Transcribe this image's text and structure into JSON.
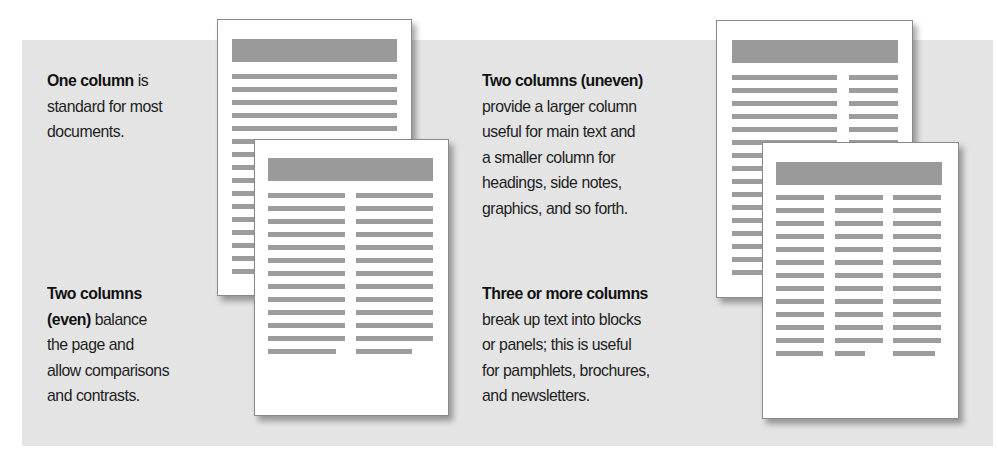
{
  "blocks": [
    {
      "id": "one-column",
      "title": "One column",
      "lines": [
        " is",
        "standard for most",
        "documents."
      ]
    },
    {
      "id": "two-columns-even",
      "title_lines": [
        "Two columns",
        "(even)"
      ],
      "lines": [
        " balance",
        "the page and",
        "allow comparisons",
        "and contrasts."
      ]
    },
    {
      "id": "two-columns-uneven",
      "title": "Two columns (uneven)",
      "lines": [
        "provide a larger column",
        "useful for main text and",
        "a smaller column for",
        "headings, side notes,",
        "graphics, and so forth."
      ]
    },
    {
      "id": "three-columns",
      "title": "Three or more columns",
      "lines": [
        "break up text into blocks",
        "or panels; this is useful",
        "for pamphlets, brochures,",
        "and newsletters."
      ]
    }
  ],
  "pages": [
    {
      "layout": "one-column",
      "rows": 16
    },
    {
      "layout": "two-columns-even",
      "rows": 13
    },
    {
      "layout": "two-columns-uneven",
      "rows": 16
    },
    {
      "layout": "three-columns",
      "rows": 13
    }
  ],
  "colors": {
    "panel_bg": "#e4e4e4",
    "page_bg": "#ffffff",
    "bar_gray": "#9c9c9c",
    "text": "#1e1e1e"
  }
}
